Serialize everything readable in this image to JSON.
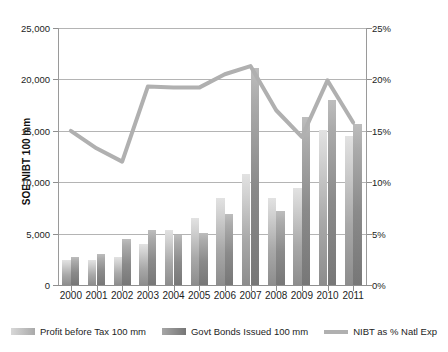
{
  "chart_data": {
    "type": "bar",
    "title": "",
    "categories": [
      "2000",
      "2001",
      "2002",
      "2003",
      "2004",
      "2005",
      "2006",
      "2007",
      "2008",
      "2009",
      "2010",
      "2011"
    ],
    "series": [
      {
        "name": "Profit before Tax 100 mm",
        "axis": "left",
        "values": [
          2400,
          2450,
          2700,
          3950,
          5350,
          6500,
          8500,
          10800,
          8500,
          9400,
          15100,
          14500
        ]
      },
      {
        "name": "Govt Bonds Issued 100 mm",
        "axis": "left",
        "values": [
          2750,
          3050,
          4500,
          5400,
          4900,
          5050,
          6900,
          21100,
          7200,
          16300,
          18000,
          15700
        ]
      },
      {
        "name": "NIBT as % Natl Exp",
        "axis": "right",
        "type": "line",
        "values": [
          15.0,
          13.3,
          12.0,
          19.3,
          19.2,
          19.2,
          20.5,
          21.3,
          17.0,
          14.4,
          19.9,
          15.8
        ]
      }
    ],
    "xlabel": "",
    "ylabel_left": "SOE NIBT 100 mm",
    "ylabel_right": "SOE NIBT as % of Budgetary Expenditures",
    "ylim_left": [
      0,
      25000
    ],
    "ylim_right": [
      0,
      25
    ],
    "yticks_left": [
      "0",
      "5,000",
      "10,000",
      "15,000",
      "20,000",
      "25,000"
    ],
    "yticks_left_values": [
      0,
      5000,
      10000,
      15000,
      20000,
      25000
    ],
    "yticks_right": [
      "0%",
      "5%",
      "10%",
      "15%",
      "20%",
      "25%"
    ],
    "yticks_right_values": [
      0,
      5,
      10,
      15,
      20,
      25
    ],
    "grid": true,
    "legend_position": "bottom"
  },
  "legend": {
    "items": [
      {
        "label": "Profit before Tax 100 mm",
        "swatch": "bar-light",
        "color": "#b4b4b4"
      },
      {
        "label": "Govt Bonds Issued 100 mm",
        "swatch": "bar-dark",
        "color": "#8a8a8a"
      },
      {
        "label": "NIBT as % Natl Exp",
        "swatch": "line",
        "color": "#b0b0b0"
      }
    ]
  },
  "colors": {
    "bar_light": "#c0c0c0",
    "bar_dark": "#8d8d8d",
    "line": "#b0b0b0",
    "grid": "#b4b4b4",
    "axis": "#8f8f8f",
    "text": "#1d1d1d",
    "background": "#ffffff"
  }
}
